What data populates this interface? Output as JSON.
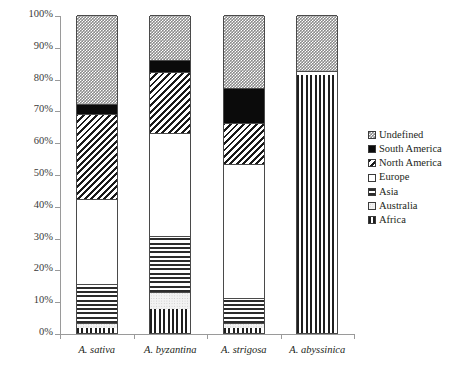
{
  "chart_data": {
    "type": "bar",
    "subtype": "stacked-100-percent",
    "title": "",
    "xlabel": "",
    "ylabel": "",
    "ylim": [
      0,
      100
    ],
    "ytick_labels": [
      "0%",
      "10%",
      "20%",
      "30%",
      "40%",
      "50%",
      "60%",
      "70%",
      "80%",
      "90%",
      "100%"
    ],
    "ytick_values": [
      0,
      10,
      20,
      30,
      40,
      50,
      60,
      70,
      80,
      90,
      100
    ],
    "grid": false,
    "legend_position": "right",
    "categories": [
      "A. sativa",
      "A. byzantina",
      "A. strigosa",
      "A. abyssinica"
    ],
    "series": [
      {
        "name": "Africa",
        "pattern": "vertical-lines",
        "values": [
          1.5,
          7.5,
          1.5,
          81.0
        ]
      },
      {
        "name": "Australia",
        "pattern": "light-dots",
        "values": [
          1.5,
          5.5,
          1.5,
          0.0
        ]
      },
      {
        "name": "Asia",
        "pattern": "horizontal-lines",
        "values": [
          12.5,
          17.5,
          8.0,
          0.0
        ]
      },
      {
        "name": "Europe",
        "pattern": "solid-white",
        "values": [
          26.5,
          32.5,
          42.0,
          1.5
        ]
      },
      {
        "name": "North America",
        "pattern": "diagonal-lines",
        "values": [
          27.0,
          19.0,
          13.0,
          0.0
        ]
      },
      {
        "name": "South America",
        "pattern": "solid-black",
        "values": [
          3.0,
          4.0,
          11.0,
          0.0
        ]
      },
      {
        "name": "Undefined",
        "pattern": "checker-gray",
        "values": [
          28.0,
          14.0,
          23.0,
          17.5
        ]
      }
    ],
    "legend_order": [
      "Undefined",
      "South America",
      "North America",
      "Europe",
      "Asia",
      "Australia",
      "Africa"
    ],
    "stack_boundaries": {
      "A. sativa": [
        0,
        1.5,
        3.0,
        15.5,
        42.0,
        69.0,
        72.0,
        100
      ],
      "A. byzantina": [
        0,
        7.5,
        13.0,
        30.5,
        63.0,
        82.0,
        86.0,
        100
      ],
      "A. strigosa": [
        0,
        1.5,
        3.0,
        11.0,
        53.0,
        66.0,
        77.0,
        100
      ],
      "A. abyssinica": [
        0,
        81.0,
        81.0,
        81.0,
        82.5,
        82.5,
        82.5,
        100
      ]
    }
  },
  "legend": {
    "items": [
      {
        "label": "Undefined"
      },
      {
        "label": "South America"
      },
      {
        "label": "North America"
      },
      {
        "label": "Europe"
      },
      {
        "label": "Asia"
      },
      {
        "label": "Australia"
      },
      {
        "label": "Africa"
      }
    ]
  },
  "axes": {
    "y_ticks": [
      {
        "label": "100%"
      },
      {
        "label": "90%"
      },
      {
        "label": "80%"
      },
      {
        "label": "70%"
      },
      {
        "label": "60%"
      },
      {
        "label": "50%"
      },
      {
        "label": "40%"
      },
      {
        "label": "30%"
      },
      {
        "label": "20%"
      },
      {
        "label": "10%"
      },
      {
        "label": "0%"
      }
    ],
    "x_labels": [
      {
        "label": "A. sativa"
      },
      {
        "label": "A. byzantina"
      },
      {
        "label": "A. strigosa"
      },
      {
        "label": "A. abyssinica"
      }
    ]
  },
  "colors": {
    "axis": "#9a9a9a",
    "text": "#231f20",
    "bar_outline": "#4a4a4a",
    "south_america": "#0b0b0b",
    "undefined_gray": "#8a8a8a",
    "australia_fill": "#f2f2f2",
    "background": "#ffffff"
  }
}
